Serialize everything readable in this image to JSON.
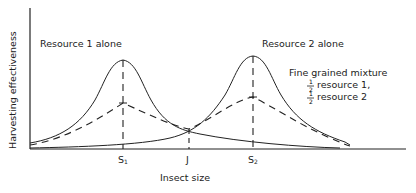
{
  "diagram": {
    "y_axis_label": "Harvesting effectiveness",
    "x_axis_label": "Insect size",
    "curve_labels": {
      "resource1": "Resource 1 alone",
      "resource2": "Resource 2 alone",
      "mixture_title": "Fine grained mixture",
      "mixture_line1": "resource 1,",
      "mixture_line2": "resource 2",
      "fraction_num": "1",
      "fraction_den": "2"
    },
    "x_ticks": {
      "s1_letter": "S",
      "s1_sub": "1",
      "j": "J",
      "s2_letter": "S",
      "s2_sub": "2"
    },
    "colors": {
      "line": "#222222",
      "background": "#ffffff"
    }
  }
}
